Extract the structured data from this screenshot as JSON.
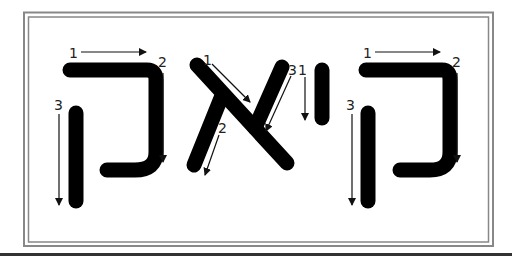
{
  "diagram": {
    "word": "קיאק",
    "letters": [
      {
        "name": "qof",
        "glyph": "ק",
        "strokes": [
          "1",
          "2",
          "3"
        ]
      },
      {
        "name": "aleph",
        "glyph": "א",
        "strokes": [
          "1",
          "2",
          "3"
        ]
      },
      {
        "name": "yod",
        "glyph": "י",
        "strokes": [
          "1"
        ]
      },
      {
        "name": "qof",
        "glyph": "ק",
        "strokes": [
          "1",
          "2",
          "3"
        ]
      }
    ],
    "colors": {
      "stroke": "#000000",
      "border": "#888888",
      "background": "#ffffff"
    }
  }
}
